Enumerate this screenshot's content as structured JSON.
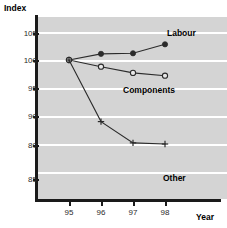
{
  "chart_data": {
    "type": "line",
    "title": "",
    "xlabel": "Year",
    "ylabel": "Index",
    "x": [
      95,
      96,
      97,
      98
    ],
    "xtick_labels": [
      "95",
      "96",
      "97",
      "98"
    ],
    "ytick_labels": [
      "105",
      "100",
      "95",
      "90",
      "80",
      "85"
    ],
    "ytick_values": [
      105,
      100,
      95,
      90,
      85,
      84
    ],
    "ylim": [
      83,
      106
    ],
    "grid": true,
    "grid_color": "#ffffff",
    "plot_background": "#d4d4d4",
    "legend_position": "inline-right",
    "series": [
      {
        "name": "Labour",
        "marker": "filled-circle",
        "color": "#2b2b2b",
        "x": [
          95,
          96,
          97,
          98
        ],
        "values": [
          100.0,
          101.1,
          101.2,
          102.8
        ]
      },
      {
        "name": "Components",
        "marker": "open-circle",
        "color": "#2b2b2b",
        "x": [
          95,
          96,
          97,
          98
        ],
        "values": [
          100.0,
          98.8,
          97.7,
          97.2
        ]
      },
      {
        "name": "Other",
        "marker": "plus",
        "color": "#2b2b2b",
        "x": [
          95,
          96,
          97,
          98
        ],
        "values": [
          100.0,
          89.0,
          85.2,
          85.0
        ]
      }
    ]
  },
  "axes": {
    "y_title": "Index",
    "x_title": "Year"
  },
  "labels": {
    "labour": "Labour",
    "components": "Components",
    "other": "Other"
  },
  "ticks": {
    "y": [
      {
        "label": "105",
        "pos": 33
      },
      {
        "label": "100",
        "pos": 60
      },
      {
        "label": "95",
        "pos": 88
      },
      {
        "label": "90",
        "pos": 116
      },
      {
        "label": "80",
        "pos": 145
      },
      {
        "label": "85",
        "pos": 179
      }
    ],
    "x": [
      {
        "label": "95",
        "pos": 69
      },
      {
        "label": "96",
        "pos": 101
      },
      {
        "label": "97",
        "pos": 133
      },
      {
        "label": "98",
        "pos": 165
      }
    ]
  }
}
